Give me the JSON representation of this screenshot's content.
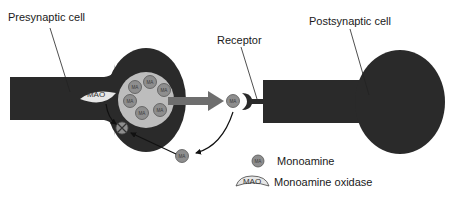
{
  "labels": {
    "presynaptic": "Presynaptic cell",
    "postsynaptic": "Postsynaptic cell",
    "receptor": "Receptor"
  },
  "enzyme": {
    "abbrev": "MAO"
  },
  "molecule": {
    "abbrev": "MA"
  },
  "legend": {
    "items": [
      {
        "symbol": "MA",
        "label": "Monoamine"
      },
      {
        "symbol": "MAO",
        "label": "Monoamine oxidase"
      }
    ]
  },
  "colors": {
    "cell_fill": "#2a2a2a",
    "vesicle_fill": "#bdbdbd",
    "molecule_fill": "#8e8e8e",
    "arrow_fill": "#6e6e6e",
    "enzyme_fill": "#e6e6e6"
  }
}
